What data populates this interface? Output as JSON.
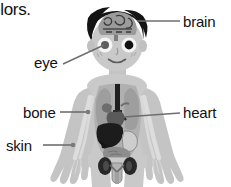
{
  "page": {
    "background_color": "#ffffff",
    "width": 231,
    "height": 187
  },
  "text_fragment": {
    "cutoff_caption": "olors."
  },
  "labels": [
    {
      "id": "brain",
      "text": "brain",
      "side": "right",
      "x": 183,
      "y": 14,
      "target": "brain-organ"
    },
    {
      "id": "eye",
      "text": "eye",
      "side": "left",
      "x": 34,
      "y": 55,
      "target": "left-eye"
    },
    {
      "id": "bone",
      "text": "bone",
      "side": "left",
      "x": 23,
      "y": 105,
      "target": "arm-bone"
    },
    {
      "id": "heart",
      "text": "heart",
      "side": "right",
      "x": 183,
      "y": 105,
      "target": "heart-organ"
    },
    {
      "id": "skin",
      "text": "skin",
      "side": "left",
      "x": 6,
      "y": 138,
      "target": "forearm-skin"
    }
  ],
  "figure": {
    "name": "child-anatomy-figure",
    "organs": [
      "brain",
      "left-eye",
      "right-eye",
      "trachea",
      "lungs",
      "heart",
      "liver",
      "stomach",
      "intestines",
      "kidneys",
      "bladder",
      "arm-bones",
      "rib-bones"
    ]
  },
  "colors": {
    "skin": "#c9c9c9",
    "skin_shadow": "#b4b4b4",
    "hair": "#141414",
    "brain": "#9a9a9a",
    "brain_lines": "#3c3c3c",
    "eye_white": "#f5f5f5",
    "pupil": "#111111",
    "torso_cavity": "#a8a8a8",
    "lung": "#9d9d9d",
    "trachea": "#222222",
    "heart": "#5e5e5e",
    "liver": "#1d1d1d",
    "stomach": "#cfcfcf",
    "intestine": "#8b8b8b",
    "kidney": "#2a2a2a",
    "bone": "#dcdcdc",
    "leader_line": "#6e6e6e",
    "label_text": "#111111"
  }
}
